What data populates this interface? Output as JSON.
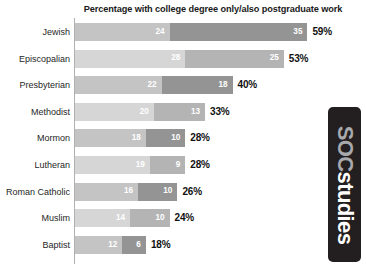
{
  "chart_data": {
    "type": "bar",
    "orientation": "horizontal",
    "stacked": true,
    "title": "Percentage with college degree only/also postgraduate work",
    "xlabel": "",
    "ylabel": "",
    "grid": false,
    "legend": null,
    "xlim": [
      0,
      59
    ],
    "categories": [
      "Jewish",
      "Episcopalian",
      "Presbyterian",
      "Methodist",
      "Mormon",
      "Lutheran",
      "Roman Catholic",
      "Muslim",
      "Baptist"
    ],
    "series": [
      {
        "name": "college degree only",
        "values": [
          24,
          28,
          22,
          20,
          18,
          19,
          16,
          14,
          12
        ]
      },
      {
        "name": "also postgraduate work",
        "values": [
          35,
          25,
          18,
          13,
          10,
          9,
          10,
          10,
          6
        ]
      }
    ],
    "totals": [
      "59%",
      "53%",
      "40%",
      "33%",
      "28%",
      "28%",
      "26%",
      "24%",
      "18%"
    ],
    "rows": [
      {
        "label": "Jewish",
        "seg1": "24",
        "seg2": "35",
        "total": "59%",
        "seg1_value": 24,
        "seg2_value": 35,
        "total_value": 59
      },
      {
        "label": "Episcopalian",
        "seg1": "28",
        "seg2": "25",
        "total": "53%",
        "seg1_value": 28,
        "seg2_value": 25,
        "total_value": 53
      },
      {
        "label": "Presbyterian",
        "seg1": "22",
        "seg2": "18",
        "total": "40%",
        "seg1_value": 22,
        "seg2_value": 18,
        "total_value": 40
      },
      {
        "label": "Methodist",
        "seg1": "20",
        "seg2": "13",
        "total": "33%",
        "seg1_value": 20,
        "seg2_value": 13,
        "total_value": 33
      },
      {
        "label": "Mormon",
        "seg1": "18",
        "seg2": "10",
        "total": "28%",
        "seg1_value": 18,
        "seg2_value": 10,
        "total_value": 28
      },
      {
        "label": "Lutheran",
        "seg1": "19",
        "seg2": "9",
        "total": "28%",
        "seg1_value": 19,
        "seg2_value": 9,
        "total_value": 28
      },
      {
        "label": "Roman Catholic",
        "seg1": "16",
        "seg2": "10",
        "total": "26%",
        "seg1_value": 16,
        "seg2_value": 10,
        "total_value": 26
      },
      {
        "label": "Muslim",
        "seg1": "14",
        "seg2": "10",
        "total": "24%",
        "seg1_value": 14,
        "seg2_value": 10,
        "total_value": 24
      },
      {
        "label": "Baptist",
        "seg1": "12",
        "seg2": "6",
        "total": "18%",
        "seg1_value": 12,
        "seg2_value": 6,
        "total_value": 18
      }
    ],
    "colors": {
      "segment1_dark": "#c4c4c4",
      "segment1_light": "#d6d6d6",
      "segment2_dark": "#949494",
      "segment2_light": "#b4b4b4",
      "axis": "#b0b0b0",
      "title_text": "#1a1a1a",
      "value_text": "#ffffff",
      "total_text": "#111111",
      "background": "#ffffff"
    }
  },
  "logo": {
    "part1": "SOC",
    "part2": "studies",
    "background": "#231f20",
    "part1_color": "#a7a9ac",
    "part2_color": "#ffffff"
  }
}
